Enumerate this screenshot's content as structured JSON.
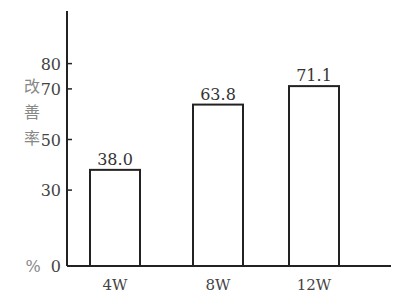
{
  "chart_data": {
    "type": "bar",
    "title": "",
    "xlabel": "",
    "ylabel": "改善率",
    "yunit": "%",
    "categories": [
      "4W",
      "8W",
      "12W"
    ],
    "values": [
      38.0,
      63.8,
      71.1
    ],
    "value_labels": [
      "38.0",
      "63.8",
      "71.1"
    ],
    "yticks": [
      0,
      30,
      50,
      70,
      80
    ],
    "ylim": [
      0,
      100
    ],
    "grid": false,
    "legend": null,
    "bar_style": {
      "fill": "#ffffff",
      "stroke": "#222222"
    }
  }
}
